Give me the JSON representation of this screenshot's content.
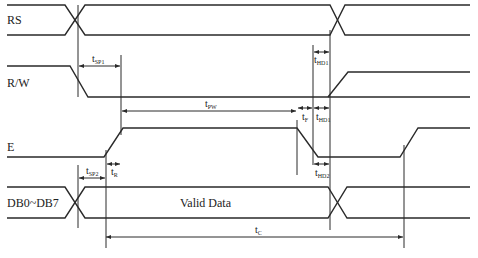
{
  "diagram": {
    "type": "timing-diagram",
    "signals": [
      {
        "name": "RS",
        "label": "RS"
      },
      {
        "name": "R/W",
        "label": "R/W"
      },
      {
        "name": "E",
        "label": "E"
      },
      {
        "name": "DB0~DB7",
        "label": "DB0~DB7",
        "center_text": "Valid Data"
      }
    ],
    "timings": {
      "tsp1": {
        "main": "t",
        "sub": "SP1"
      },
      "thd1_top": {
        "main": "t",
        "sub": "HD1"
      },
      "tpw": {
        "main": "t",
        "sub": "PW"
      },
      "tf": {
        "main": "t",
        "sub": "F"
      },
      "thd1_mid": {
        "main": "t",
        "sub": "HD1"
      },
      "tr": {
        "main": "t",
        "sub": "R"
      },
      "tsp2": {
        "main": "t",
        "sub": "SP2"
      },
      "thd2": {
        "main": "t",
        "sub": "HD2"
      },
      "tc": {
        "main": "t",
        "sub": "C"
      }
    },
    "line_color": "#2a2a2a"
  }
}
